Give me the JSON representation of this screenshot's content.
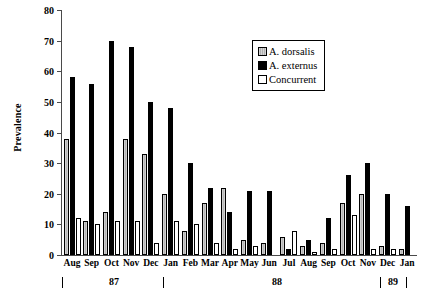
{
  "chart_data": {
    "type": "bar",
    "title": "",
    "xlabel": "",
    "ylabel": "Prevalence",
    "ylim": [
      0,
      80
    ],
    "yticks": [
      0,
      10,
      20,
      30,
      40,
      50,
      60,
      70,
      80
    ],
    "grid": false,
    "legend_position": "top-right",
    "categories": [
      "Aug",
      "Sep",
      "Oct",
      "Nov",
      "Dec",
      "Jan",
      "Feb",
      "Mar",
      "Apr",
      "May",
      "Jun",
      "Jul",
      "Aug",
      "Sep",
      "Oct",
      "Nov",
      "Dec",
      "Jan"
    ],
    "series": [
      {
        "name": "A. dorsalis",
        "color": "#c9c9c9",
        "values": [
          38,
          11,
          14,
          38,
          33,
          20,
          8,
          17,
          22,
          5,
          4,
          6,
          3,
          4,
          17,
          20,
          3,
          2
        ]
      },
      {
        "name": "A. externus",
        "color": "#000000",
        "values": [
          58,
          56,
          70,
          68,
          50,
          48,
          30,
          22,
          14,
          21,
          21,
          2,
          5,
          12,
          26,
          30,
          20,
          16
        ]
      },
      {
        "name": "Concurrent",
        "color": "#ffffff",
        "values": [
          12,
          10,
          11,
          11,
          4,
          11,
          10,
          4,
          2,
          3,
          0,
          8,
          1,
          2,
          13,
          2,
          2,
          0
        ]
      }
    ],
    "year_markers": [
      {
        "label": "87",
        "tick_before": true
      },
      {
        "label": "88",
        "tick_before": true
      },
      {
        "label": "89",
        "tick_before": true
      }
    ]
  },
  "legend": {
    "items": [
      {
        "label": "A. dorsalis"
      },
      {
        "label": "A. externus"
      },
      {
        "label": "Concurrent"
      }
    ]
  },
  "years": {
    "y87": "87",
    "y88": "88",
    "y89": "89"
  }
}
